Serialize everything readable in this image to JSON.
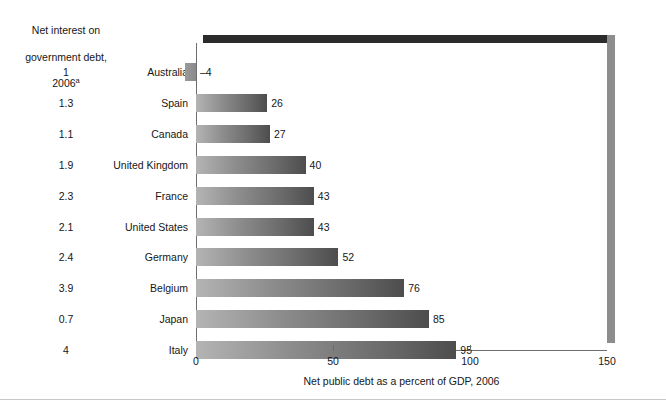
{
  "chart_data": {
    "type": "bar",
    "orientation": "horizontal",
    "title": "",
    "xlabel": "Net public debt as a percent of GDP, 2006",
    "ylabel": "",
    "xlim": [
      0,
      150
    ],
    "xticks": [
      0,
      50,
      100,
      150
    ],
    "xtick_labels": [
      "0",
      "50",
      "100",
      "150"
    ],
    "grid": false,
    "legend": null,
    "categories": [
      "Australia",
      "Spain",
      "Canada",
      "United Kingdom",
      "France",
      "United States",
      "Germany",
      "Belgium",
      "Japan",
      "Italy"
    ],
    "values": [
      -4,
      26,
      27,
      40,
      43,
      43,
      52,
      76,
      85,
      95
    ],
    "value_labels": [
      "–4",
      "26",
      "27",
      "40",
      "43",
      "43",
      "52",
      "76",
      "85",
      "95"
    ],
    "series": [
      {
        "name": "Net public debt as a percent of GDP, 2006",
        "values": [
          -4,
          26,
          27,
          40,
          43,
          43,
          52,
          76,
          85,
          95
        ]
      },
      {
        "name": "Net interest on government debt, 2006",
        "values": [
          1,
          1.3,
          1.1,
          1.9,
          2.3,
          2.1,
          2.4,
          3.9,
          0.7,
          4
        ]
      }
    ],
    "interest_labels": [
      "1",
      "1.3",
      "1.1",
      "1.9",
      "2.3",
      "2.1",
      "2.4",
      "3.9",
      "0.7",
      "4"
    ],
    "colors": {
      "bar_gradient_start": "#b4b4b4",
      "bar_gradient_end": "#4d4d4d",
      "frame_top": "#2b2b2b",
      "frame_right": "#8d8d8d",
      "axis": "#6e6e6e",
      "text": "#161616",
      "background": "#ffffff"
    }
  },
  "left_header": {
    "line1": "Net interest on",
    "line2": "government debt,",
    "line3": "2006",
    "footnote_marker": "a"
  },
  "rows": [
    {
      "interest": "1",
      "country": "Australia",
      "value": "–4",
      "value_num": -4
    },
    {
      "interest": "1.3",
      "country": "Spain",
      "value": "26",
      "value_num": 26
    },
    {
      "interest": "1.1",
      "country": "Canada",
      "value": "27",
      "value_num": 27
    },
    {
      "interest": "1.9",
      "country": "United Kingdom",
      "value": "40",
      "value_num": 40
    },
    {
      "interest": "2.3",
      "country": "France",
      "value": "43",
      "value_num": 43
    },
    {
      "interest": "2.1",
      "country": "United States",
      "value": "43",
      "value_num": 43
    },
    {
      "interest": "2.4",
      "country": "Germany",
      "value": "52",
      "value_num": 52
    },
    {
      "interest": "3.9",
      "country": "Belgium",
      "value": "76",
      "value_num": 76
    },
    {
      "interest": "0.7",
      "country": "Japan",
      "value": "85",
      "value_num": 85
    },
    {
      "interest": "4",
      "country": "Italy",
      "value": "95",
      "value_num": 95
    }
  ],
  "axis": {
    "ticks": [
      "0",
      "50",
      "100",
      "150"
    ],
    "caption": "Net public debt as a percent of GDP, 2006"
  }
}
